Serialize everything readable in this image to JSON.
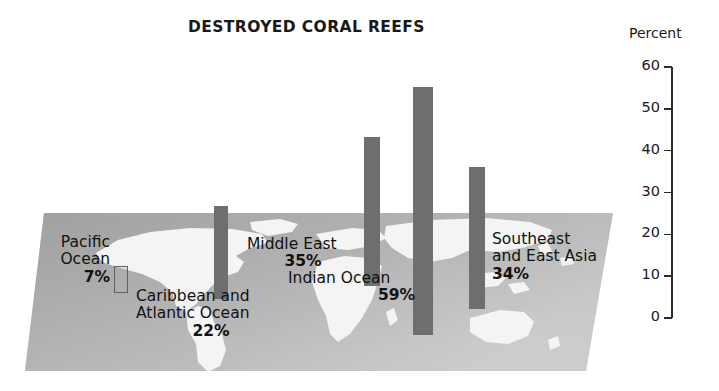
{
  "header": {
    "title": "DESTROYED CORAL REEFS"
  },
  "axis": {
    "caption": "Percent",
    "ticks": [
      "60",
      "50",
      "40",
      "30",
      "20",
      "10",
      "0"
    ]
  },
  "labels": {
    "pacific": {
      "line1": "Pacific",
      "line2": "Ocean",
      "value": "7%"
    },
    "caribbean": {
      "line1": "Caribbean and",
      "line2": "Atlantic Ocean",
      "value": "22%"
    },
    "middleeast": {
      "line1": "Middle East",
      "line2": "",
      "value": "35%"
    },
    "indian": {
      "line1": "Indian Ocean",
      "line2": "",
      "value": "59%"
    },
    "seasia": {
      "line1": "Southeast",
      "line2": "and East Asia",
      "value": "34%"
    }
  },
  "colors": {
    "bar": "#6e6e6e",
    "bar_light": "#afafaf",
    "platform_light": "#b9b9b9",
    "platform_dark": "#8d8d8d",
    "land": "#f3f3f3",
    "text": "#111111"
  },
  "chart_data": {
    "type": "bar",
    "title": "DESTROYED CORAL REEFS",
    "xlabel": "",
    "ylabel": "Percent",
    "ylim": [
      0,
      60
    ],
    "yticks": [
      0,
      10,
      20,
      30,
      40,
      50,
      60
    ],
    "grid": false,
    "legend": "none",
    "categories": [
      "Pacific Ocean",
      "Caribbean and Atlantic Ocean",
      "Middle East",
      "Indian Ocean",
      "Southeast and East Asia"
    ],
    "values": [
      7,
      22,
      35,
      59,
      34
    ],
    "data_labels": [
      "7%",
      "22%",
      "35%",
      "59%",
      "34%"
    ],
    "note": "Bars drawn in 3-D perspective standing on a world map platform; label text overlaid on the map."
  }
}
